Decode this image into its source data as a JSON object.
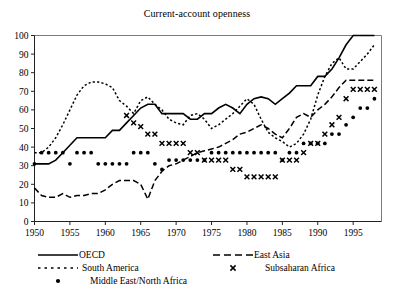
{
  "chart_data": {
    "type": "line",
    "title": "Current-account openness",
    "xlabel": "",
    "ylabel": "",
    "xlim": [
      1950,
      1999
    ],
    "ylim": [
      0,
      100
    ],
    "xticks": [
      1950,
      1955,
      1960,
      1965,
      1970,
      1975,
      1980,
      1985,
      1990,
      1995
    ],
    "yticks": [
      0,
      10,
      20,
      30,
      40,
      50,
      60,
      70,
      80,
      90,
      100
    ],
    "grid": false,
    "legend_position": "below-plot",
    "series": [
      {
        "name": "OECD",
        "style": "solid-line",
        "marker": "none",
        "color": "#000000",
        "x": [
          1950,
          1951,
          1952,
          1953,
          1954,
          1955,
          1956,
          1957,
          1958,
          1959,
          1960,
          1961,
          1962,
          1963,
          1964,
          1965,
          1966,
          1967,
          1968,
          1969,
          1970,
          1971,
          1972,
          1973,
          1974,
          1975,
          1976,
          1977,
          1978,
          1979,
          1980,
          1981,
          1982,
          1983,
          1984,
          1985,
          1986,
          1987,
          1988,
          1989,
          1990,
          1991,
          1992,
          1993,
          1994,
          1995,
          1996,
          1997,
          1998
        ],
        "values": [
          31,
          31,
          31,
          33,
          37,
          41,
          45,
          45,
          45,
          45,
          45,
          49,
          49,
          53,
          57,
          61,
          63,
          63,
          58,
          58,
          58,
          58,
          55,
          55,
          58,
          58,
          61,
          63,
          61,
          58,
          63,
          66,
          67,
          66,
          63,
          66,
          69,
          73,
          73,
          73,
          78,
          78,
          82,
          88,
          95,
          100,
          100,
          100,
          100
        ]
      },
      {
        "name": "East Asia",
        "style": "dashed-line",
        "marker": "none",
        "color": "#000000",
        "x": [
          1950,
          1951,
          1952,
          1953,
          1954,
          1955,
          1956,
          1957,
          1958,
          1959,
          1960,
          1961,
          1962,
          1963,
          1964,
          1965,
          1966,
          1967,
          1968,
          1969,
          1970,
          1971,
          1972,
          1973,
          1974,
          1975,
          1976,
          1977,
          1978,
          1979,
          1980,
          1981,
          1982,
          1983,
          1984,
          1985,
          1986,
          1987,
          1988,
          1989,
          1990,
          1991,
          1992,
          1993,
          1994,
          1995,
          1996,
          1997,
          1998
        ],
        "values": [
          18,
          14,
          13,
          13,
          15,
          13,
          14,
          14,
          15,
          15,
          17,
          20,
          22,
          22,
          22,
          20,
          12,
          22,
          27,
          30,
          31,
          33,
          35,
          37,
          38,
          39,
          40,
          42,
          44,
          47,
          48,
          50,
          52,
          50,
          47,
          45,
          50,
          56,
          58,
          56,
          60,
          63,
          67,
          72,
          76,
          76,
          76,
          76,
          76
        ]
      },
      {
        "name": "South America",
        "style": "dotted-line",
        "marker": "none",
        "color": "#000000",
        "x": [
          1950,
          1951,
          1952,
          1953,
          1954,
          1955,
          1956,
          1957,
          1958,
          1959,
          1960,
          1961,
          1962,
          1963,
          1964,
          1965,
          1966,
          1967,
          1968,
          1969,
          1970,
          1971,
          1972,
          1973,
          1974,
          1975,
          1976,
          1977,
          1978,
          1979,
          1980,
          1981,
          1982,
          1983,
          1984,
          1985,
          1986,
          1987,
          1988,
          1989,
          1990,
          1991,
          1992,
          1993,
          1994,
          1995,
          1996,
          1997,
          1998
        ],
        "values": [
          37,
          37,
          40,
          45,
          52,
          60,
          68,
          73,
          75,
          75,
          74,
          72,
          65,
          62,
          58,
          65,
          67,
          63,
          60,
          55,
          53,
          52,
          57,
          58,
          55,
          50,
          52,
          55,
          58,
          62,
          66,
          63,
          55,
          48,
          45,
          43,
          40,
          42,
          47,
          55,
          68,
          78,
          85,
          88,
          82,
          82,
          86,
          90,
          95
        ]
      },
      {
        "name": "Middle East/North Africa",
        "style": "markers",
        "marker": "dot",
        "color": "#000000",
        "x": [
          1950,
          1951,
          1952,
          1953,
          1954,
          1955,
          1956,
          1957,
          1958,
          1959,
          1960,
          1961,
          1962,
          1963,
          1964,
          1965,
          1966,
          1967,
          1968,
          1969,
          1970,
          1971,
          1972,
          1973,
          1974,
          1975,
          1976,
          1977,
          1978,
          1979,
          1980,
          1981,
          1982,
          1983,
          1984,
          1985,
          1986,
          1987,
          1988,
          1989,
          1990,
          1991,
          1992,
          1993,
          1994,
          1995,
          1996,
          1997,
          1998
        ],
        "values": [
          31,
          37,
          37,
          37,
          37,
          31,
          37,
          37,
          37,
          31,
          31,
          31,
          31,
          31,
          37,
          37,
          37,
          31,
          28,
          33,
          33,
          33,
          33,
          33,
          33,
          37,
          37,
          37,
          37,
          37,
          37,
          37,
          37,
          37,
          37,
          33,
          37,
          37,
          42,
          42,
          42,
          42,
          47,
          47,
          52,
          56,
          61,
          61,
          66
        ]
      },
      {
        "name": "Subsaharan Africa",
        "style": "markers",
        "marker": "x",
        "color": "#000000",
        "x": [
          1963,
          1964,
          1965,
          1966,
          1967,
          1968,
          1969,
          1970,
          1971,
          1972,
          1973,
          1974,
          1975,
          1976,
          1977,
          1978,
          1979,
          1980,
          1981,
          1982,
          1983,
          1984,
          1985,
          1986,
          1987,
          1988,
          1989,
          1990,
          1991,
          1992,
          1993,
          1994,
          1995,
          1996,
          1997,
          1998
        ],
        "values": [
          57,
          53,
          51,
          47,
          47,
          42,
          42,
          42,
          42,
          37,
          37,
          33,
          33,
          33,
          33,
          28,
          28,
          24,
          24,
          24,
          24,
          24,
          33,
          33,
          33,
          37,
          42,
          42,
          47,
          52,
          56,
          66,
          71,
          71,
          71,
          71
        ]
      }
    ],
    "legend": [
      {
        "label": "OECD",
        "style": "solid-line"
      },
      {
        "label": "East Asia",
        "style": "dashed-line"
      },
      {
        "label": "South America",
        "style": "dotted-line"
      },
      {
        "label": "Subsaharan Africa",
        "style": "x-marker"
      },
      {
        "label": "Middle East/North Africa",
        "style": "dot-marker"
      }
    ]
  }
}
